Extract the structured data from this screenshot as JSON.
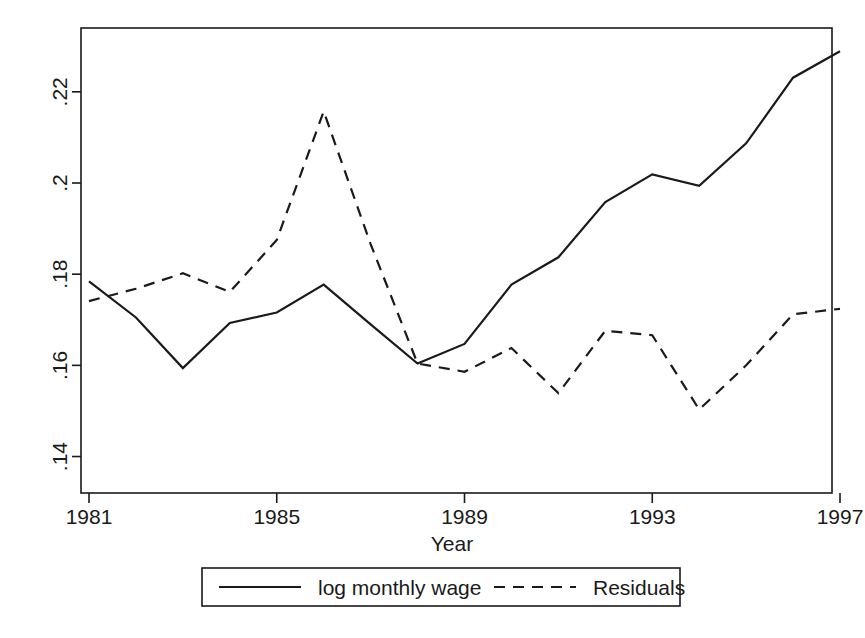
{
  "chart_data": {
    "type": "line",
    "title": "",
    "subtitle": "",
    "xlabel": "Year",
    "ylabel": "",
    "x": [
      1981,
      1982,
      1983,
      1984,
      1985,
      1986,
      1987,
      1988,
      1989,
      1990,
      1991,
      1992,
      1993,
      1994,
      1995,
      1996,
      1997
    ],
    "xlim": [
      1981,
      1997
    ],
    "ylim": [
      0.132,
      0.234
    ],
    "xticks": [
      1981,
      1985,
      1989,
      1993,
      1997
    ],
    "xtick_labels": [
      "1981",
      "1985",
      "1989",
      "1993",
      "1997"
    ],
    "yticks": [
      0.14,
      0.16,
      0.18,
      0.2,
      0.22
    ],
    "ytick_labels": [
      ".14",
      ".16",
      ".18",
      ".2",
      ".22"
    ],
    "grid": false,
    "legend_position": "bottom-outside",
    "series": [
      {
        "name": "log monthly wage",
        "style": "solid",
        "color": "#1a1a1a",
        "values": [
          0.1784,
          0.1705,
          0.1594,
          0.1693,
          0.1716,
          0.1777,
          0.169,
          0.1604,
          0.1647,
          0.1777,
          0.1837,
          0.1958,
          0.2019,
          0.1994,
          0.2087,
          0.2231,
          0.2289
        ]
      },
      {
        "name": "Residuals",
        "style": "dashed",
        "color": "#1a1a1a",
        "values": [
          0.1741,
          0.1768,
          0.1802,
          0.1761,
          0.1875,
          0.2157,
          0.1866,
          0.1604,
          0.1586,
          0.1638,
          0.1539,
          0.1676,
          0.1666,
          0.1503,
          0.16,
          0.1712,
          0.1724
        ]
      }
    ],
    "annotations": []
  },
  "legend": {
    "entries": [
      {
        "label": "log monthly wage",
        "style": "solid"
      },
      {
        "label": "Residuals",
        "style": "dashed"
      }
    ]
  },
  "axes": {
    "x_title": "Year",
    "x_tick_labels": [
      "1981",
      "1985",
      "1989",
      "1993",
      "1997"
    ],
    "y_tick_labels": [
      ".14",
      ".16",
      ".18",
      ".2",
      ".22"
    ]
  },
  "colors": {
    "background": "#ffffff",
    "ink": "#1a1a1a"
  }
}
